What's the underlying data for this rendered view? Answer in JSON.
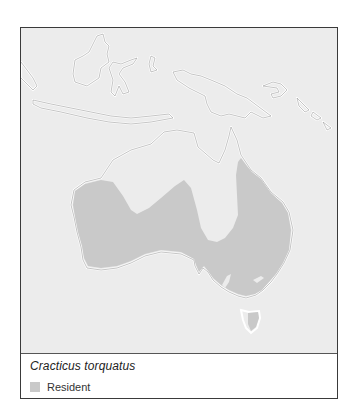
{
  "map": {
    "region": "Australasia",
    "land_color": "#ececec",
    "sea_color": "#ececec",
    "coast_color": "#ffffff",
    "range_color": "#c9c9c9"
  },
  "legend": {
    "species": "Cracticus torquatus",
    "items": [
      {
        "label": "Resident",
        "color": "#c9c9c9",
        "icon": "legend-swatch"
      }
    ]
  }
}
